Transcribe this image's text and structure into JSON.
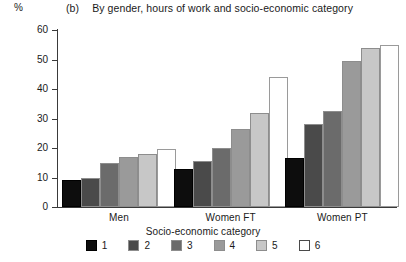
{
  "header": {
    "unit_label": "%",
    "title_index": "(b)",
    "title_text": "By gender, hours of work and socio-economic category"
  },
  "chart_data": {
    "type": "bar",
    "title": "By gender, hours of work and socio-economic category",
    "xlabel": "Socio-economic category",
    "ylabel": "%",
    "ylim": [
      0,
      60
    ],
    "yticks": [
      0,
      10,
      20,
      30,
      40,
      50,
      60
    ],
    "grid": false,
    "legend_position": "bottom",
    "categories": [
      "Men",
      "Women FT",
      "Women PT"
    ],
    "series": [
      {
        "name": "1",
        "color": "#0d0d0d",
        "values": [
          9,
          13,
          16.5
        ]
      },
      {
        "name": "2",
        "color": "#4a4a4a",
        "values": [
          10,
          15.5,
          28
        ]
      },
      {
        "name": "3",
        "color": "#6b6b6b",
        "values": [
          15,
          20,
          32.5
        ]
      },
      {
        "name": "4",
        "color": "#9a9a9a",
        "values": [
          17,
          26.5,
          49.5
        ]
      },
      {
        "name": "5",
        "color": "#c7c7c7",
        "values": [
          18,
          32,
          54
        ]
      },
      {
        "name": "6",
        "color": "#ffffff",
        "values": [
          19.5,
          44,
          55
        ]
      }
    ]
  },
  "legend": {
    "items": [
      {
        "label": "1",
        "color": "#0d0d0d"
      },
      {
        "label": "2",
        "color": "#4a4a4a"
      },
      {
        "label": "3",
        "color": "#6b6b6b"
      },
      {
        "label": "4",
        "color": "#9a9a9a"
      },
      {
        "label": "5",
        "color": "#c7c7c7"
      },
      {
        "label": "6",
        "color": "#ffffff"
      }
    ]
  }
}
